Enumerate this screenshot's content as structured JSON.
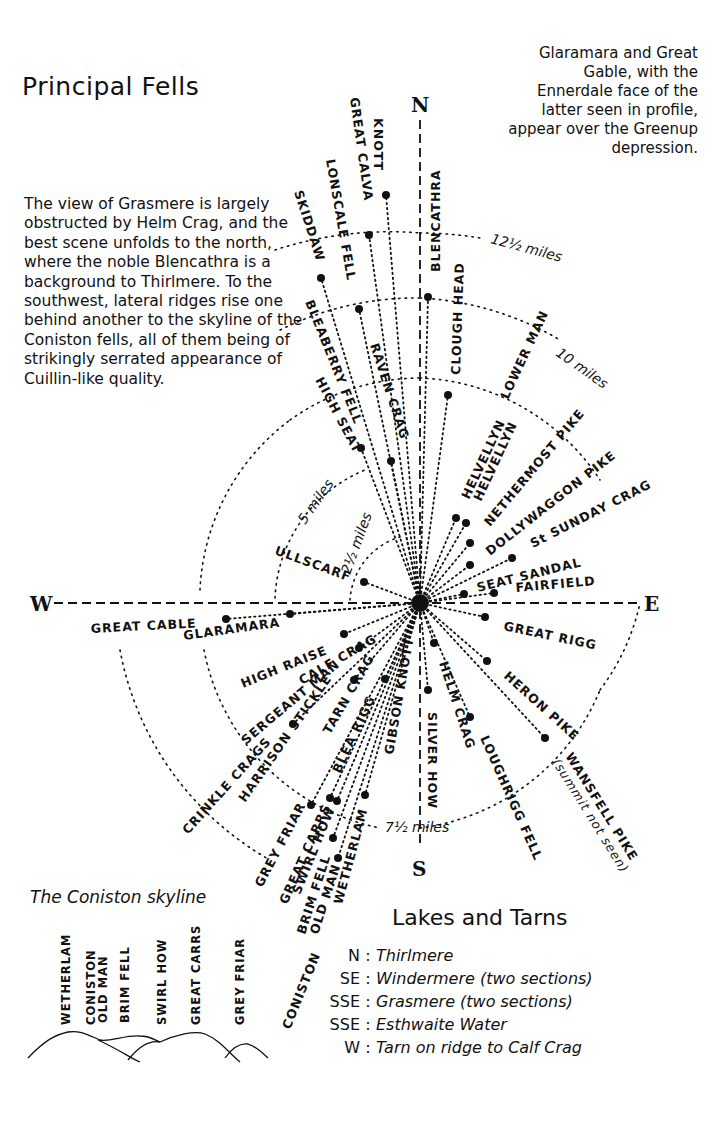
{
  "title": "Principal Fells",
  "top_note": "Glaramara and Great Gable, with the Ennerdale face of the latter seen in profile, appear over the Greenup depression.",
  "left_note": "The view of Grasmere is largely obstructed by Helm Crag, and the best scene unfolds to the north, where the noble Blencathra is a background to Thirlmere. To the southwest, lateral ridges rise one behind another to the skyline of the Coniston fells, all of them being of strikingly serrated appearance of Cuillin-like quality.",
  "compass": {
    "n": "N",
    "e": "E",
    "s": "S",
    "w": "W"
  },
  "rings": [
    {
      "label": "2½ miles",
      "miles": 2.5
    },
    {
      "label": "5 miles",
      "miles": 5
    },
    {
      "label": "7½ miles",
      "miles": 7.5
    },
    {
      "label": "10 miles",
      "miles": 10
    },
    {
      "label": "12½ miles",
      "miles": 12.5
    }
  ],
  "fells": [
    {
      "name": "KNOTT"
    },
    {
      "name": "GREAT CALVA"
    },
    {
      "name": "LONSCALE FELL"
    },
    {
      "name": "SKIDDAW"
    },
    {
      "name": "BLENCATHRA"
    },
    {
      "name": "CLOUGH HEAD"
    },
    {
      "name": "BLEABERRY FELL"
    },
    {
      "name": "HIGH SEAT"
    },
    {
      "name": "RAVEN CRAG"
    },
    {
      "name": "LOWER MAN"
    },
    {
      "name": "HELVELLYN"
    },
    {
      "name": "HELVELLYN"
    },
    {
      "name": "NETHERMOST PIKE"
    },
    {
      "name": "DOLLYWAGGON PIKE"
    },
    {
      "name": "St SUNDAY CRAG"
    },
    {
      "name": "SEAT SANDAL"
    },
    {
      "name": "FAIRFIELD"
    },
    {
      "name": "ULLSCARF"
    },
    {
      "name": "GREAT CABLE"
    },
    {
      "name": "GLARAMARA"
    },
    {
      "name": "HIGH RAISE"
    },
    {
      "name": "CALF CRAG"
    },
    {
      "name": "SERGEANT MAN"
    },
    {
      "name": "CRINKLE CRAGS"
    },
    {
      "name": "HARRISON STICKLE"
    },
    {
      "name": "TARN CRAG"
    },
    {
      "name": "BLEA RIGG"
    },
    {
      "name": "GIBSON KNOTT"
    },
    {
      "name": "GREAT RIGG"
    },
    {
      "name": "HERON PIKE"
    },
    {
      "name": "HELM CRAG"
    },
    {
      "name": "SILVER HOW"
    },
    {
      "name": "LOUGHRIGG FELL"
    },
    {
      "name": "WANSFELL PIKE"
    },
    {
      "name": "(summit not seen)"
    },
    {
      "name": "GREY FRIAR"
    },
    {
      "name": "GREAT CARRS"
    },
    {
      "name": "SWIRL HOW"
    },
    {
      "name": "BRIM FELL"
    },
    {
      "name": "OLD MAN"
    },
    {
      "name": "WETHERLAM"
    },
    {
      "name": "CONISTON"
    }
  ],
  "skyline": {
    "title": "The Coniston skyline",
    "peaks": [
      "WETHERLAM",
      "CONISTON",
      "OLD MAN",
      "BRIM FELL",
      "SWIRL HOW",
      "GREAT CARRS",
      "GREY FRIAR"
    ]
  },
  "lakes": {
    "title": "Lakes and Tarns",
    "items": [
      {
        "dir": "N",
        "name": "Thirlmere"
      },
      {
        "dir": "SE",
        "name": "Windermere (two sections)"
      },
      {
        "dir": "SSE",
        "name": "Grasmere (two sections)"
      },
      {
        "dir": "SSE",
        "name": "Esthwaite Water"
      },
      {
        "dir": "W",
        "name": "Tarn on ridge to Calf Crag"
      }
    ]
  }
}
